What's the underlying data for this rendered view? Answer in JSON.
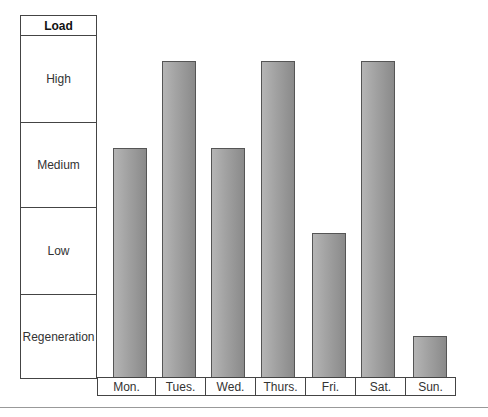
{
  "chart_data": {
    "type": "bar",
    "title": "",
    "xlabel": "",
    "ylabel": "Load",
    "categories": [
      "Mon.",
      "Tues.",
      "Wed.",
      "Thurs.",
      "Fri.",
      "Sat.",
      "Sun."
    ],
    "y_levels": [
      "Regeneration",
      "Low",
      "Medium",
      "High"
    ],
    "values": [
      2.67,
      3.67,
      2.67,
      3.67,
      1.67,
      3.67,
      0.48
    ],
    "values_by_level": [
      "Medium",
      "High",
      "Medium",
      "High",
      "Low",
      "High",
      "Regeneration"
    ],
    "ylim": [
      0,
      4
    ],
    "grid": false,
    "legend": "none",
    "bar_color": "#a3a3a3"
  },
  "legend_table": {
    "header": "Load",
    "rows": [
      "High",
      "Medium",
      "Low",
      "Regeneration"
    ]
  },
  "bars": [
    {
      "day": "Mon.",
      "left": 16,
      "top": 148
    },
    {
      "day": "Tues.",
      "left": 65,
      "top": 61
    },
    {
      "day": "Wed.",
      "left": 114,
      "top": 148
    },
    {
      "day": "Thurs.",
      "left": 164,
      "top": 61
    },
    {
      "day": "Fri.",
      "left": 215,
      "top": 233
    },
    {
      "day": "Sat.",
      "left": 264,
      "top": 61
    },
    {
      "day": "Sun.",
      "left": 316,
      "top": 336
    }
  ]
}
